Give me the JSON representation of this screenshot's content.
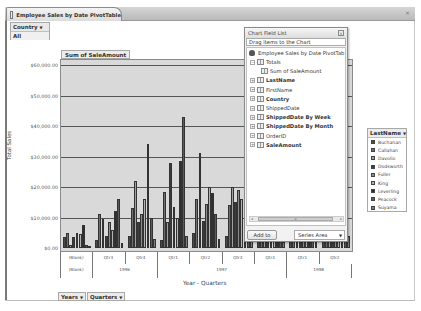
{
  "tab": {
    "title": "Employee Sales by Date PivotTable",
    "close_icon": "×"
  },
  "filter": {
    "field": "Country",
    "value": "All"
  },
  "data_field": "Sum of SaleAmount",
  "field_list": {
    "title": "Chart Field List",
    "hint": "Drag items to the Chart",
    "root": "Employee Sales by Date PivotTab",
    "nodes": [
      {
        "label": "Totals",
        "bold": false,
        "level": 1
      },
      {
        "label": "Sum of SaleAmount",
        "bold": false,
        "level": 2
      },
      {
        "label": "LastName",
        "bold": true,
        "level": 1
      },
      {
        "label": "FirstName",
        "bold": false,
        "level": 1
      },
      {
        "label": "Country",
        "bold": true,
        "level": 1
      },
      {
        "label": "ShippedDate",
        "bold": false,
        "level": 1
      },
      {
        "label": "ShippedDate By Week",
        "bold": true,
        "level": 1
      },
      {
        "label": "ShippedDate By Month",
        "bold": true,
        "level": 1
      },
      {
        "label": "OrderID",
        "bold": false,
        "level": 1
      },
      {
        "label": "SaleAmount",
        "bold": true,
        "level": 1
      }
    ],
    "add_button": "Add to",
    "area_select": "Series Area"
  },
  "legend": {
    "field": "LastName",
    "items": [
      {
        "label": "Buchanan",
        "color": "#4a4a4a"
      },
      {
        "label": "Callahan",
        "color": "#6e6e6e"
      },
      {
        "label": "Davolio",
        "color": "#a0a0a0"
      },
      {
        "label": "Dodsworth",
        "color": "#3c3c3c"
      },
      {
        "label": "Fuller",
        "color": "#8c8c8c"
      },
      {
        "label": "King",
        "color": "#b4b4b4"
      },
      {
        "label": "Leverling",
        "color": "#2e2e2e"
      },
      {
        "label": "Peacock",
        "color": "#5a5a5a"
      },
      {
        "label": "Suyama",
        "color": "#7e7e7e"
      }
    ]
  },
  "category_buttons": [
    "Years",
    "Quarters"
  ],
  "chart_data": {
    "type": "bar",
    "title": "",
    "xlabel": "Year - Quarters",
    "ylabel": "Total Sales",
    "ylim": [
      0,
      60000
    ],
    "yticks": [
      "$0.00",
      "$10,000.00",
      "$20,000.00",
      "$30,000.00",
      "$40,000.00",
      "$50,000.00",
      "$60,000.00"
    ],
    "grid": true,
    "legend_position": "right",
    "categories": [
      "(Blank)",
      "1996 Qtr3",
      "1996 Qtr4",
      "1997 Qtr1",
      "1997 Qtr2",
      "1997 Qtr3",
      "1997 Qtr4",
      "1998 Qtr1",
      "1998 Qtr2"
    ],
    "quarter_labels": [
      "(Blank)",
      "Qtr3",
      "Qtr4",
      "Qtr1",
      "Qtr2",
      "Qtr3",
      "Qtr4",
      "Qtr1",
      "Qtr2"
    ],
    "year_labels": [
      {
        "label": "(Blank)",
        "span": 1
      },
      {
        "label": "1996",
        "span": 2
      },
      {
        "label": "1997",
        "span": 4
      },
      {
        "label": "1998",
        "span": 2
      }
    ],
    "series": [
      {
        "name": "Buchanan",
        "values": [
          3500,
          2500,
          4000,
          2500,
          5000,
          4000,
          2500,
          4000,
          3000
        ]
      },
      {
        "name": "Callahan",
        "values": [
          5000,
          11000,
          13000,
          18500,
          16000,
          14000,
          6000,
          7000,
          6500
        ]
      },
      {
        "name": "Davolio",
        "values": [
          1000,
          9500,
          22000,
          8500,
          31000,
          20000,
          16000,
          33000,
          9000
        ]
      },
      {
        "name": "Dodsworth",
        "values": [
          3500,
          4000,
          8500,
          28000,
          9000,
          15000,
          7000,
          25000,
          5000
        ]
      },
      {
        "name": "Fuller",
        "values": [
          5000,
          8500,
          11000,
          13500,
          14500,
          19000,
          14000,
          10000,
          9000
        ]
      },
      {
        "name": "King",
        "values": [
          4500,
          6000,
          16000,
          10000,
          20000,
          16000,
          30000,
          12000,
          7000
        ]
      },
      {
        "name": "Leverling",
        "values": [
          7500,
          12000,
          34000,
          28500,
          18000,
          25000,
          11000,
          26000,
          22000
        ]
      },
      {
        "name": "Peacock",
        "values": [
          1000,
          16000,
          10000,
          43000,
          11000,
          10000,
          7000,
          5000,
          13000
        ]
      },
      {
        "name": "Suyama",
        "values": [
          500,
          1500,
          3000,
          4000,
          3000,
          5000,
          2000,
          7000,
          4000
        ]
      }
    ]
  }
}
